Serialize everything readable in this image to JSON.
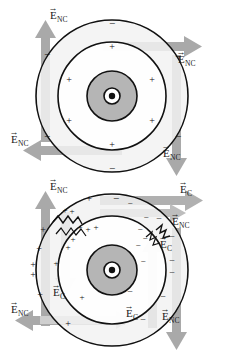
{
  "figure": {
    "background": "#ffffff",
    "colors": {
      "arrow_gray": "#a8a8a8",
      "arrow_gray_dark": "#999999",
      "ring_fill": "#f2f2f2",
      "ring_fill_inner": "#ffffff",
      "nucleus_fill": "#b5b5b5",
      "stroke_black": "#111111",
      "label_color": "#1a1a1a"
    },
    "panels": [
      {
        "id": "panel-top",
        "name": "uniform-ring-nonconservative-field",
        "center": {
          "x": 112,
          "y": 96
        },
        "radii": {
          "outer": 76,
          "middle": 54,
          "nucleus": 25,
          "core": 8,
          "core_dot": 3
        },
        "magnetic_field_symbol": "dot-in-circle",
        "magnetic_field_meaning": "B out of page",
        "arrows": [
          {
            "name": "arrow-enc-top-left-up",
            "direction": "up",
            "label": "E⃗NC",
            "label_x": 49,
            "label_y": 17
          },
          {
            "name": "arrow-enc-top-right-right",
            "direction": "right",
            "label": "E⃗NC",
            "label_x": 176,
            "label_y": 52
          },
          {
            "name": "arrow-enc-bottom-left-left",
            "direction": "left",
            "label": "E⃗NC",
            "label_x": 12,
            "label_y": 143
          },
          {
            "name": "arrow-enc-bottom-right-down",
            "direction": "down",
            "label": "E⃗NC",
            "label_x": 167,
            "label_y": 155
          }
        ],
        "charges": {
          "outer_ring_sign": "−",
          "inner_ring_sign": "+",
          "outer_count": 6,
          "inner_count": 6
        },
        "labels": [
          "E⃗NC",
          "E⃗NC",
          "E⃗NC",
          "E⃗NC"
        ]
      },
      {
        "id": "panel-bottom",
        "name": "split-ring-with-conservative-and-nonconservative-fields",
        "center": {
          "x": 112,
          "y": 270
        },
        "radii": {
          "outer": 76,
          "middle": 54,
          "nucleus": 25,
          "core": 8,
          "core_dot": 3
        },
        "magnetic_field_symbol": "dot-in-circle",
        "magnetic_field_meaning": "B out of page",
        "gaps": [
          {
            "name": "ring-gap-top-left",
            "angle_deg": 215,
            "style": "sawtooth"
          },
          {
            "name": "ring-gap-right",
            "angle_deg": 330,
            "style": "sawtooth"
          }
        ],
        "arrows": [
          {
            "name": "arrow-enc-top-left-up",
            "direction": "up",
            "label": "E⃗NC",
            "label_x": 49,
            "label_y": 188
          },
          {
            "name": "arrow-ec-top-right-right",
            "direction": "right",
            "label": "E⃗C",
            "label_x": 180,
            "label_y": 192
          },
          {
            "name": "arrow-enc-right-right",
            "direction": "right",
            "label": "E⃗NC",
            "label_x": 172,
            "label_y": 222
          },
          {
            "name": "arrow-ec-right-up",
            "direction": "up",
            "label": "E⃗C",
            "label_x": 168,
            "label_y": 245
          },
          {
            "name": "arrow-enc-right-down",
            "direction": "down",
            "label": "E⃗NC",
            "label_x": 165,
            "label_y": 318
          },
          {
            "name": "arrow-ec-left-down",
            "direction": "down",
            "label": "E⃗C",
            "label_x": 53,
            "label_y": 294
          },
          {
            "name": "arrow-enc-bottom-left-left",
            "direction": "left",
            "label": "E⃗NC",
            "label_x": 10,
            "label_y": 312
          },
          {
            "name": "arrow-ec-bottom-right",
            "direction": "right",
            "label": "E⃗C",
            "label_x": 130,
            "label_y": 315
          }
        ],
        "charges": {
          "left_sign": "+",
          "right_sign": "−",
          "note": "positive charge accumulates on the left side, negative on the right side of the split ring"
        },
        "labels": [
          "E⃗NC",
          "E⃗C",
          "E⃗NC",
          "E⃗C",
          "E⃗NC",
          "E⃗C",
          "E⃗NC",
          "E⃗C"
        ]
      }
    ],
    "symbols": {
      "E_nc": "E⃗NC",
      "E_c": "E⃗C",
      "plus": "+",
      "minus": "−",
      "E_letter": "E",
      "sub_nc": "NC",
      "sub_c": "C"
    }
  }
}
